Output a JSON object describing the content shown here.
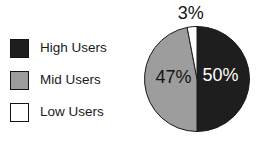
{
  "figure": {
    "background": "#ffffff"
  },
  "chart_data": {
    "type": "pie",
    "title": "",
    "legend_position": "left",
    "start_angle_deg": 0,
    "direction": "clockwise",
    "slice_outline_color": "#1a1a1a",
    "slices": [
      {
        "label": "High Users",
        "value": 50,
        "display": "50%",
        "color": "#1e1e1e",
        "text_color": "#ffffff"
      },
      {
        "label": "Mid Users",
        "value": 47,
        "display": "47%",
        "color": "#9d9d9d",
        "text_color": "#141414"
      },
      {
        "label": "Low Users",
        "value": 3,
        "display": "3%",
        "color": "#ffffff",
        "text_color": "#141414"
      }
    ]
  }
}
